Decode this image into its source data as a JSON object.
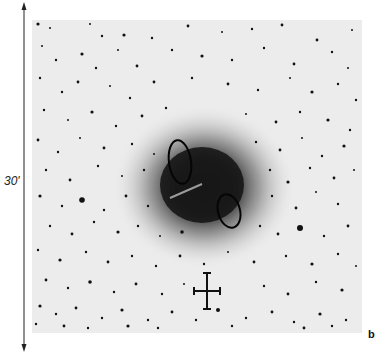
{
  "figure": {
    "panel_label": "b",
    "scale": {
      "label": "30'",
      "orientation": "vertical"
    },
    "plate_background": "#ececec",
    "nebula": {
      "core_color": "#141414",
      "halo_color": "#7a7a7a",
      "center": [
        172,
        167
      ],
      "contours": [
        {
          "name": "upper-left-contour",
          "cx": 148,
          "cy": 142,
          "rx": 11,
          "ry": 22,
          "rotate": -8
        },
        {
          "name": "lower-right-contour",
          "cx": 197,
          "cy": 191,
          "rx": 11,
          "ry": 17,
          "rotate": -15
        }
      ],
      "streak": {
        "x1": 138,
        "y1": 178,
        "x2": 170,
        "y2": 164
      }
    },
    "marker": {
      "type": "cross",
      "description": "position marker"
    },
    "stars": [
      [
        6,
        4,
        1.6
      ],
      [
        18,
        8,
        1
      ],
      [
        58,
        4,
        1
      ],
      [
        70,
        16,
        1.2
      ],
      [
        92,
        15,
        1.6
      ],
      [
        120,
        18,
        1.2
      ],
      [
        156,
        6,
        1.4
      ],
      [
        190,
        12,
        1
      ],
      [
        220,
        9,
        1.2
      ],
      [
        250,
        5,
        1.4
      ],
      [
        285,
        20,
        1.4
      ],
      [
        320,
        10,
        1
      ],
      [
        10,
        26,
        1
      ],
      [
        24,
        40,
        1.2
      ],
      [
        50,
        34,
        1.6
      ],
      [
        64,
        48,
        1.2
      ],
      [
        86,
        30,
        1
      ],
      [
        105,
        46,
        1.4
      ],
      [
        140,
        30,
        1.2
      ],
      [
        170,
        36,
        1.6
      ],
      [
        200,
        40,
        1.2
      ],
      [
        232,
        28,
        1.2
      ],
      [
        262,
        44,
        1.4
      ],
      [
        300,
        32,
        1.2
      ],
      [
        316,
        48,
        1
      ],
      [
        8,
        58,
        1.2
      ],
      [
        30,
        72,
        1.2
      ],
      [
        46,
        62,
        1.4
      ],
      [
        78,
        66,
        1
      ],
      [
        98,
        78,
        1.2
      ],
      [
        122,
        62,
        1.4
      ],
      [
        160,
        58,
        1.2
      ],
      [
        196,
        64,
        1.4
      ],
      [
        226,
        70,
        1.2
      ],
      [
        258,
        58,
        1
      ],
      [
        280,
        72,
        1.6
      ],
      [
        306,
        64,
        1.2
      ],
      [
        324,
        80,
        1.2
      ],
      [
        12,
        90,
        1.2
      ],
      [
        36,
        100,
        1
      ],
      [
        60,
        92,
        1.6
      ],
      [
        84,
        106,
        1.2
      ],
      [
        110,
        96,
        1.4
      ],
      [
        134,
        88,
        1.2
      ],
      [
        214,
        94,
        1
      ],
      [
        244,
        102,
        1.4
      ],
      [
        268,
        92,
        1.2
      ],
      [
        296,
        100,
        1.6
      ],
      [
        318,
        110,
        1.2
      ],
      [
        6,
        120,
        1.4
      ],
      [
        26,
        132,
        1.2
      ],
      [
        48,
        118,
        1
      ],
      [
        72,
        128,
        1.4
      ],
      [
        100,
        124,
        1.2
      ],
      [
        122,
        134,
        1
      ],
      [
        224,
        122,
        1.2
      ],
      [
        248,
        130,
        1.4
      ],
      [
        270,
        118,
        1
      ],
      [
        290,
        136,
        1.2
      ],
      [
        312,
        126,
        1.6
      ],
      [
        14,
        150,
        1.2
      ],
      [
        38,
        160,
        1.4
      ],
      [
        66,
        146,
        1.2
      ],
      [
        90,
        156,
        1
      ],
      [
        112,
        150,
        1.2
      ],
      [
        238,
        150,
        1.2
      ],
      [
        256,
        162,
        1.6
      ],
      [
        278,
        148,
        1.2
      ],
      [
        302,
        158,
        1.4
      ],
      [
        322,
        150,
        1
      ],
      [
        8,
        176,
        1.6
      ],
      [
        30,
        186,
        1.2
      ],
      [
        50,
        180,
        2.8
      ],
      [
        72,
        190,
        1.2
      ],
      [
        94,
        176,
        1.4
      ],
      [
        116,
        186,
        1.2
      ],
      [
        240,
        176,
        1.2
      ],
      [
        264,
        188,
        1.4
      ],
      [
        284,
        172,
        1
      ],
      [
        306,
        184,
        1.2
      ],
      [
        18,
        206,
        1.2
      ],
      [
        40,
        214,
        1.4
      ],
      [
        62,
        202,
        1.2
      ],
      [
        86,
        212,
        1.6
      ],
      [
        106,
        206,
        1.2
      ],
      [
        128,
        216,
        1
      ],
      [
        150,
        212,
        1.8
      ],
      [
        228,
        206,
        1.2
      ],
      [
        246,
        214,
        1.4
      ],
      [
        268,
        208,
        3
      ],
      [
        292,
        216,
        1.2
      ],
      [
        316,
        206,
        1.4
      ],
      [
        6,
        230,
        1.2
      ],
      [
        28,
        240,
        1.6
      ],
      [
        54,
        232,
        1.2
      ],
      [
        76,
        242,
        1.4
      ],
      [
        100,
        236,
        1.2
      ],
      [
        124,
        246,
        1.2
      ],
      [
        148,
        236,
        1.4
      ],
      [
        172,
        244,
        1.2
      ],
      [
        196,
        232,
        1
      ],
      [
        222,
        242,
        1.4
      ],
      [
        254,
        236,
        1.2
      ],
      [
        280,
        244,
        1.6
      ],
      [
        306,
        234,
        1.2
      ],
      [
        324,
        246,
        1
      ],
      [
        14,
        260,
        1.4
      ],
      [
        36,
        268,
        1.2
      ],
      [
        58,
        262,
        1.8
      ],
      [
        82,
        272,
        1.2
      ],
      [
        104,
        264,
        1.4
      ],
      [
        130,
        274,
        1.2
      ],
      [
        152,
        264,
        1
      ],
      [
        232,
        266,
        1.2
      ],
      [
        256,
        274,
        1.4
      ],
      [
        284,
        262,
        1.2
      ],
      [
        310,
        270,
        1.6
      ],
      [
        8,
        286,
        1.6
      ],
      [
        24,
        294,
        1.2
      ],
      [
        44,
        288,
        1.4
      ],
      [
        70,
        298,
        1.2
      ],
      [
        90,
        290,
        1.6
      ],
      [
        116,
        300,
        1.2
      ],
      [
        140,
        292,
        1.4
      ],
      [
        164,
        300,
        1.2
      ],
      [
        186,
        290,
        2
      ],
      [
        214,
        298,
        1.2
      ],
      [
        240,
        292,
        1.4
      ],
      [
        262,
        302,
        1.2
      ],
      [
        288,
        294,
        1.6
      ],
      [
        314,
        300,
        1.2
      ],
      [
        4,
        304,
        1.2
      ],
      [
        32,
        306,
        1.4
      ],
      [
        56,
        308,
        1.2
      ],
      [
        96,
        306,
        1.6
      ],
      [
        126,
        308,
        1.2
      ],
      [
        200,
        306,
        1.2
      ],
      [
        272,
        308,
        1.4
      ],
      [
        300,
        306,
        1.2
      ]
    ]
  }
}
